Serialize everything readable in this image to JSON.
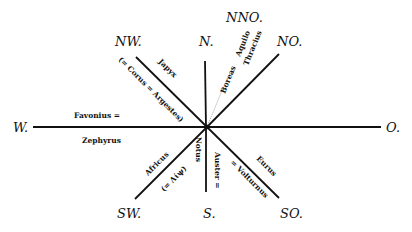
{
  "directions": {
    "N": "N.",
    "NNO": "NNO.",
    "NO": "NO.",
    "O": "O.",
    "SO": "SO.",
    "S": "S.",
    "SW": "SW.",
    "W": "W.",
    "NW": "NW."
  },
  "winds": {
    "nw_upper": "Japyx",
    "nw_lower": "(= Corus = Argestes)",
    "nno_a": "Boreas",
    "nno_b": "Aquilo",
    "nno_c": "Thracius",
    "w_upper": "Favonius =",
    "w_lower": "Zephyrus",
    "sw_upper": "Africus",
    "sw_lower": "(= Λίψ)",
    "s_left": "Notus",
    "s_right": "Auster =",
    "so_upper": "Eurus",
    "so_lower": "= Volturnus"
  },
  "colors": {
    "ink": "#111111",
    "background": "#ffffff"
  }
}
